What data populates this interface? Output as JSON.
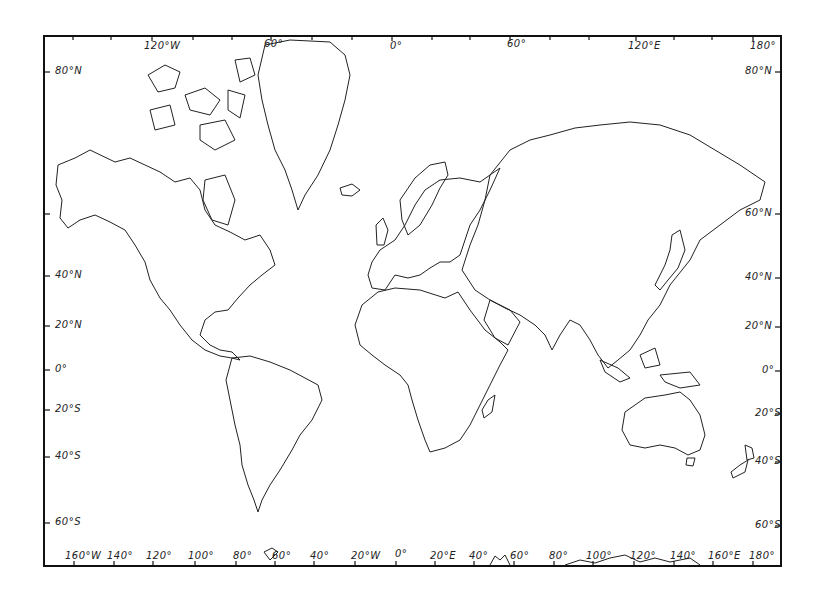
{
  "map": {
    "title": "",
    "projection": "Mercator",
    "style": "outline",
    "colors": {
      "line": "#222222",
      "background": "#ffffff"
    },
    "top_axis_labels": [
      {
        "text": "120°W",
        "x": 148,
        "y": 46
      },
      {
        "text": "60°",
        "x": 265,
        "y": 44
      },
      {
        "text": "0°",
        "x": 392,
        "y": 46
      },
      {
        "text": "60°",
        "x": 508,
        "y": 44
      },
      {
        "text": "120°E",
        "x": 630,
        "y": 46
      },
      {
        "text": "180°",
        "x": 750,
        "y": 46
      }
    ],
    "bottom_axis_labels": [
      {
        "text": "160°W",
        "x": 65
      },
      {
        "text": "140°",
        "x": 107
      },
      {
        "text": "120°",
        "x": 147
      },
      {
        "text": "100°",
        "x": 188
      },
      {
        "text": "80°",
        "x": 234
      },
      {
        "text": "60°",
        "x": 273
      },
      {
        "text": "40°",
        "x": 310
      },
      {
        "text": "20°W",
        "x": 351
      },
      {
        "text": "0°",
        "x": 395
      },
      {
        "text": "20°E",
        "x": 430
      },
      {
        "text": "40°",
        "x": 469
      },
      {
        "text": "60°",
        "x": 510
      },
      {
        "text": "80°",
        "x": 549
      },
      {
        "text": "100°",
        "x": 586
      },
      {
        "text": "120°",
        "x": 630
      },
      {
        "text": "140°",
        "x": 670
      },
      {
        "text": "160°E",
        "x": 708
      },
      {
        "text": "180°",
        "x": 749
      }
    ],
    "left_axis_labels": [
      {
        "text": "80°N",
        "y": 72
      },
      {
        "text": "40°N",
        "y": 276
      },
      {
        "text": "20°N",
        "y": 326
      },
      {
        "text": "0°",
        "y": 370
      },
      {
        "text": "20°S",
        "y": 410
      },
      {
        "text": "40°S",
        "y": 457
      },
      {
        "text": "60°S",
        "y": 523
      }
    ],
    "right_axis_labels": [
      {
        "text": "80°N",
        "y": 72
      },
      {
        "text": "60°N",
        "y": 214
      },
      {
        "text": "40°N",
        "y": 278
      },
      {
        "text": "20°N",
        "y": 327
      },
      {
        "text": "0°",
        "y": 371
      },
      {
        "text": "20°S",
        "y": 414
      },
      {
        "text": "40°S",
        "y": 462
      },
      {
        "text": "60°S",
        "y": 526
      }
    ]
  }
}
